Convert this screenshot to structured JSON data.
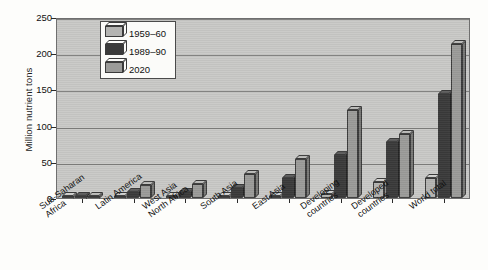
{
  "chart_data": {
    "type": "bar",
    "title": "",
    "xlabel": "",
    "ylabel": "Million nutrient tons",
    "ylim": [
      0,
      250
    ],
    "yticks": [
      0,
      50,
      100,
      150,
      200,
      250
    ],
    "grid": true,
    "legend_position": "top-left",
    "style": "3d-grouped-bar-grayscale",
    "categories": [
      "Sub-Saharan\nAfrica",
      "Latin America",
      "West Asia\nNorth Africa",
      "South Asia",
      "East Asia",
      "Developing\ncountries",
      "Developed\ncountries",
      "World total"
    ],
    "category_labels": [
      [
        "Sub-Saharan",
        "Africa"
      ],
      [
        "Latin America"
      ],
      [
        "West Asia",
        "North Africa"
      ],
      [
        "South Asia"
      ],
      [
        "East Asia"
      ],
      [
        "Developing",
        "countries"
      ],
      [
        "Developed",
        "countries"
      ],
      [
        "World total"
      ]
    ],
    "series": [
      {
        "name": "1959–60",
        "color": "#b4b4b2",
        "values": [
          1,
          1,
          1,
          1,
          2,
          5,
          22,
          27
        ]
      },
      {
        "name": "1989–90",
        "color": "#3a3a3a",
        "values": [
          1,
          8,
          8,
          14,
          27,
          60,
          78,
          143
        ]
      },
      {
        "name": "2020",
        "color": "#9b9b99",
        "values": [
          3,
          18,
          19,
          33,
          54,
          122,
          88,
          213
        ]
      }
    ]
  },
  "legend": {
    "items": [
      {
        "label": "1959–60"
      },
      {
        "label": "1989–90"
      },
      {
        "label": "2020"
      }
    ]
  },
  "axes": {
    "y_title": "Million nutrient tons"
  }
}
